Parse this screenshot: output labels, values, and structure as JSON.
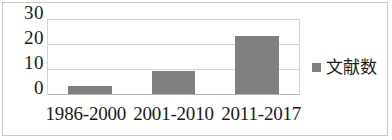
{
  "chart_data": {
    "type": "bar",
    "title": "",
    "subtitle": "",
    "xlabel": "",
    "ylabel": "",
    "categories": [
      "1986-2000",
      "2001-2010",
      "2011-2017"
    ],
    "series": [
      {
        "name": "文献数",
        "values": [
          3,
          9,
          23
        ],
        "color": "#808080"
      }
    ],
    "ylim": [
      0,
      30
    ],
    "yticks": [
      0,
      10,
      20,
      30
    ],
    "ytick_labels": [
      "0",
      "10",
      "20",
      "30"
    ],
    "grid": true,
    "grid_axis": "y",
    "legend": {
      "position": "right",
      "entries": [
        {
          "label": "文献数",
          "marker": "square",
          "color": "#808080"
        }
      ]
    },
    "annotations": [],
    "border_color": "#c9c9c9",
    "gridline_color": "#d4d4d4",
    "background": "#ffffff",
    "text_color": "#1a1a1a"
  }
}
